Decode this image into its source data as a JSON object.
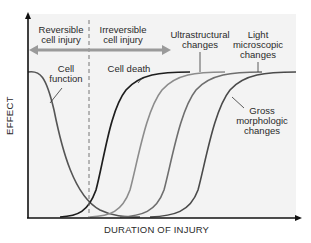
{
  "diagram": {
    "title": "",
    "xlabel": "DURATION OF INJURY",
    "ylabel": "EFFECT",
    "regions": {
      "reversible": "Reversible cell injury",
      "reversible_line1": "Reversible",
      "reversible_line2": "cell injury",
      "irreversible": "Irreversible cell injury",
      "irreversible_line1": "Irreversible",
      "irreversible_line2": "cell injury"
    },
    "curves": [
      {
        "id": "cell-function",
        "label_line1": "Cell",
        "label_line2": "function",
        "trend": "decreasing",
        "color": "#555555"
      },
      {
        "id": "cell-death",
        "label_line1": "Cell death",
        "label_line2": "",
        "trend": "increasing",
        "color": "#1e1e1e"
      },
      {
        "id": "ultrastructural",
        "label_line1": "Ultrastructural",
        "label_line2": "changes",
        "trend": "increasing",
        "color": "#8c8c8c"
      },
      {
        "id": "light-microscopic",
        "label_line1": "Light",
        "label_line2": "microscopic",
        "label_line3": "changes",
        "trend": "increasing",
        "color": "#6e6e6e"
      },
      {
        "id": "gross-morphologic",
        "label_line1": "Gross",
        "label_line2": "morphologic",
        "label_line3": "changes",
        "trend": "increasing",
        "color": "#4a4a4a"
      }
    ],
    "colors": {
      "axis": "#111111",
      "arrow": "#9a9a9a",
      "dashed": "#777777",
      "background": "#f3f3f3"
    }
  }
}
